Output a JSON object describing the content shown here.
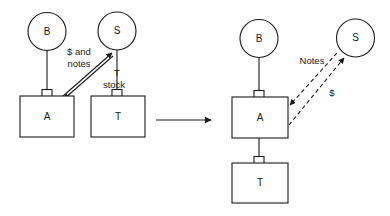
{
  "diagram": {
    "background_color": "#ffffff",
    "line_color": "#1a1a1a",
    "panels": [
      {
        "id": "before",
        "nodes": [
          {
            "id": "before-b",
            "shape": "circle",
            "label": "B"
          },
          {
            "id": "before-s",
            "shape": "circle",
            "label": "S"
          },
          {
            "id": "before-a",
            "shape": "box",
            "label": "A"
          },
          {
            "id": "before-t",
            "shape": "box",
            "label": "T"
          }
        ],
        "edges": [
          {
            "id": "before-b-a",
            "from": "B",
            "to": "A",
            "style": "solid",
            "label": ""
          },
          {
            "id": "before-s-t",
            "from": "S",
            "to": "T",
            "style": "solid",
            "label": ""
          },
          {
            "id": "before-a-s",
            "from": "A",
            "to": "S",
            "style": "solid",
            "arrow": "up-right",
            "label": "$ and notes",
            "label_line_1": "$ and",
            "label_line_2": "notes"
          },
          {
            "id": "before-s-a",
            "from": "S",
            "to": "A",
            "style": "solid",
            "arrow": "down-left",
            "label": "T stock",
            "label_line_1": "T",
            "label_line_2": "stock"
          }
        ]
      },
      {
        "id": "after",
        "nodes": [
          {
            "id": "after-b",
            "shape": "circle",
            "label": "B"
          },
          {
            "id": "after-s",
            "shape": "circle",
            "label": "S"
          },
          {
            "id": "after-a",
            "shape": "box",
            "label": "A"
          },
          {
            "id": "after-t",
            "shape": "box",
            "label": "T"
          }
        ],
        "edges": [
          {
            "id": "after-b-a",
            "from": "B",
            "to": "A",
            "style": "solid",
            "label": ""
          },
          {
            "id": "after-a-t",
            "from": "A",
            "to": "T",
            "style": "solid",
            "label": ""
          },
          {
            "id": "after-a-s-notes",
            "from": "S",
            "to": "A",
            "style": "dashed",
            "arrow": "down-left",
            "label": "Notes"
          },
          {
            "id": "after-a-s-cash",
            "from": "A",
            "to": "S",
            "style": "dashed",
            "arrow": "up-right",
            "label": "$"
          }
        ]
      }
    ],
    "transition": {
      "id": "transition-arrow",
      "style": "solid",
      "arrow": "right",
      "label": ""
    }
  }
}
